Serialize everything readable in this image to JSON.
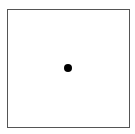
{
  "diagram": {
    "frame": {
      "shape": "square",
      "border_color": "#555555",
      "fill_color": "#ffffff"
    },
    "point": {
      "shape": "circle",
      "color": "#000000",
      "position": "center"
    }
  }
}
